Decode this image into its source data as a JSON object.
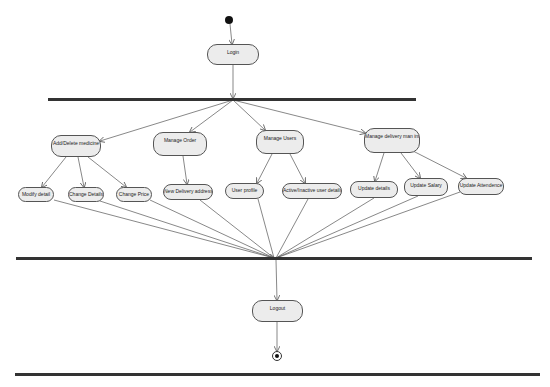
{
  "diagram": {
    "type": "UML activity diagram",
    "start": {
      "label": "start"
    },
    "end": {
      "label": "end"
    },
    "nodes": {
      "login": "Login",
      "add_delete_medicine": "Add/Delete medicine",
      "manage_order": "Manage Order",
      "manage_users": "Manage Users",
      "manage_delivery_man": "Manage delivery man info",
      "modify_detail": "Modify detail",
      "change_details": "Change Details",
      "change_price": "Change Price",
      "new_delivery_address": "New Delivery address",
      "user_profile": "User profile",
      "active_inactive_user": "Active/Inactive user details",
      "update_details": "Update details",
      "update_salary": "Update Salary",
      "update_attendence": "Update Attendence",
      "logout": "Logout"
    },
    "bars": [
      "fork",
      "join",
      "bottom"
    ],
    "edges": [
      [
        "start",
        "login"
      ],
      [
        "login",
        "fork"
      ],
      [
        "fork",
        "add_delete_medicine"
      ],
      [
        "fork",
        "manage_order"
      ],
      [
        "fork",
        "manage_users"
      ],
      [
        "fork",
        "manage_delivery_man"
      ],
      [
        "add_delete_medicine",
        "modify_detail"
      ],
      [
        "add_delete_medicine",
        "change_details"
      ],
      [
        "add_delete_medicine",
        "change_price"
      ],
      [
        "manage_order",
        "new_delivery_address"
      ],
      [
        "manage_users",
        "user_profile"
      ],
      [
        "manage_users",
        "active_inactive_user"
      ],
      [
        "manage_delivery_man",
        "update_details"
      ],
      [
        "manage_delivery_man",
        "update_salary"
      ],
      [
        "manage_delivery_man",
        "update_attendence"
      ],
      [
        "modify_detail",
        "join"
      ],
      [
        "change_details",
        "join"
      ],
      [
        "change_price",
        "join"
      ],
      [
        "new_delivery_address",
        "join"
      ],
      [
        "user_profile",
        "join"
      ],
      [
        "active_inactive_user",
        "join"
      ],
      [
        "update_details",
        "join"
      ],
      [
        "update_salary",
        "join"
      ],
      [
        "update_attendence",
        "join"
      ],
      [
        "join",
        "logout"
      ],
      [
        "logout",
        "end"
      ]
    ],
    "colors": {
      "node_fill": "#ececec",
      "node_border": "#555555",
      "bar": "#333333",
      "edge": "#555555"
    }
  }
}
